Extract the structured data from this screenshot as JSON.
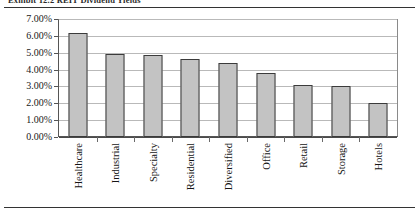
{
  "figure": {
    "caption": "Exhibit 12.2    REIT Dividend Yields"
  },
  "chart_data": {
    "type": "bar",
    "title": "",
    "subtitle": "",
    "xlabel": "",
    "ylabel": "",
    "categories": [
      "Healthcare",
      "Industrial",
      "Specialty",
      "Residential",
      "Diversified",
      "Office",
      "Retail",
      "Storage",
      "Hotels"
    ],
    "values": [
      6.15,
      4.9,
      4.85,
      4.6,
      4.4,
      3.8,
      3.1,
      3.05,
      2.0
    ],
    "value_labels": [
      "6.15%",
      "4.90%",
      "4.85%",
      "4.60%",
      "4.40%",
      "3.80%",
      "3.10%",
      "3.05%",
      "2.00%"
    ],
    "ylim": [
      0,
      7
    ],
    "ytick_values": [
      0,
      1,
      2,
      3,
      4,
      5,
      6,
      7
    ],
    "ytick_labels": [
      "0.00%",
      "1.00%",
      "2.00%",
      "3.00%",
      "4.00%",
      "5.00%",
      "6.00%",
      "7.00%"
    ],
    "grid": true,
    "grid_axis": "y",
    "legend": false,
    "legend_position": "none",
    "bar_fill_color": "#c3c3c3",
    "bar_edge_color": "#3b3b3b",
    "gridline_color": "#b9b9b9",
    "frame_color": "#7a7a7a",
    "background_color": "#ffffff",
    "xtick_label_rotation": -90
  }
}
